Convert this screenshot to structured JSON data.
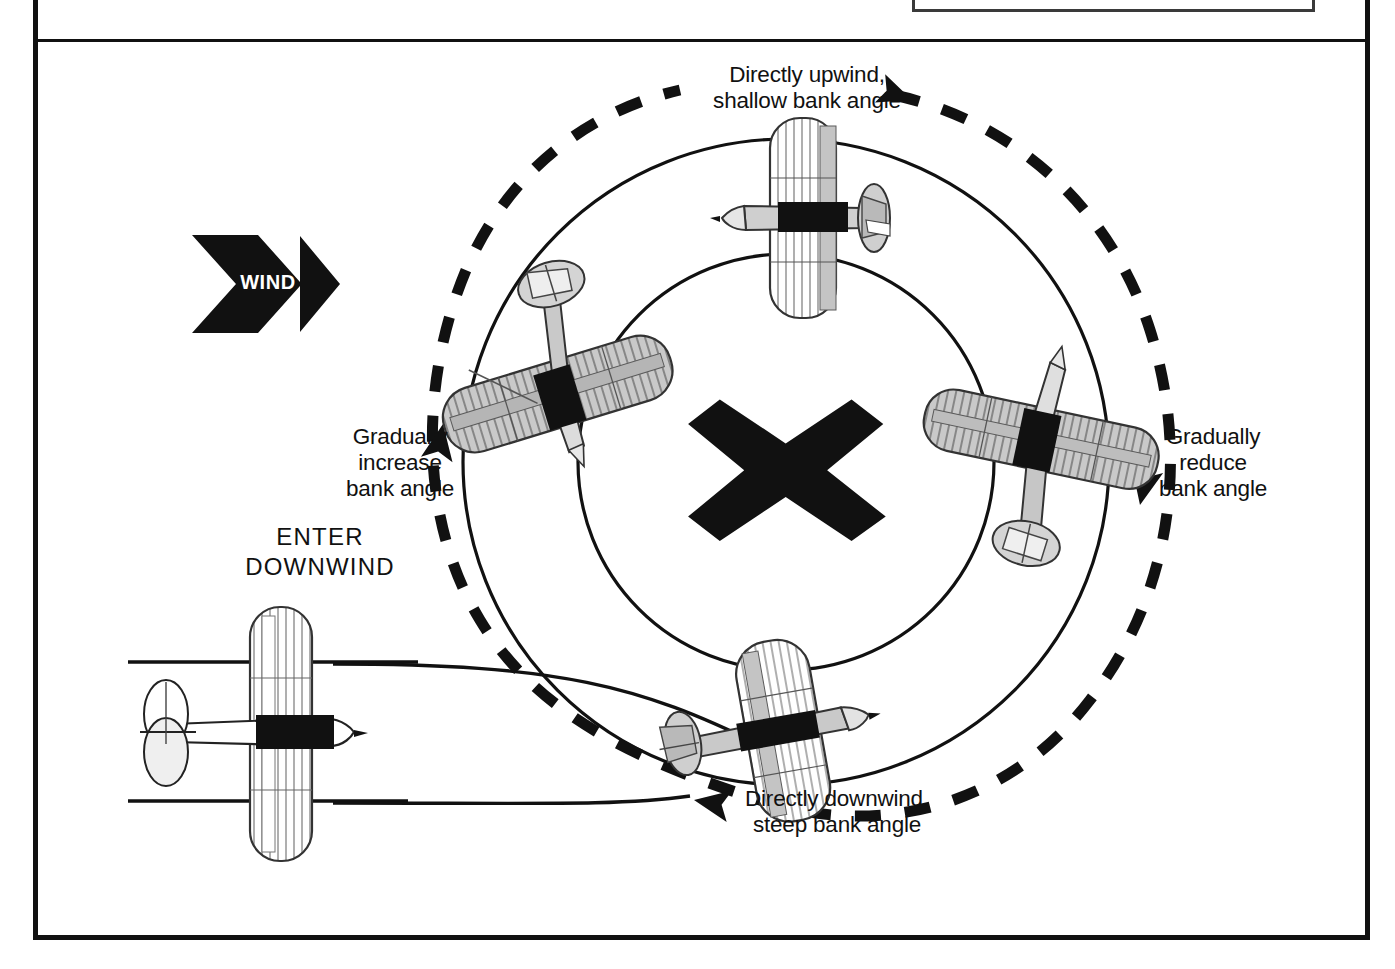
{
  "diagram": {
    "center_marker": "x-ground-reference-point",
    "wind": {
      "label": "WIND",
      "direction": "left-to-right"
    },
    "labels": {
      "upwind": "Directly upwind,\nshallow bank angle",
      "downwind": "Directly downwind,\nsteep bank angle",
      "increase_bank": "Gradually\nincrease\nbank angle",
      "reduce_bank": "Gradually\nreduce\nbank angle",
      "enter": "ENTER\nDOWNWIND"
    },
    "aircraft": [
      {
        "name": "aircraft-upwind",
        "position": "top",
        "bank": "shallow"
      },
      {
        "name": "aircraft-crosswind-left",
        "position": "left",
        "bank": "increasing"
      },
      {
        "name": "aircraft-crosswind-right",
        "position": "right",
        "bank": "decreasing"
      },
      {
        "name": "aircraft-downwind",
        "position": "bottom",
        "bank": "steep"
      },
      {
        "name": "aircraft-entry",
        "position": "left-entry",
        "bank": "level"
      }
    ],
    "colors": {
      "ink": "#111111",
      "frame": "#111111",
      "paper": "#ffffff",
      "aircraft_fill": "#d8d8d8",
      "aircraft_shadow": "#9a9a9a"
    },
    "caption_box": ""
  }
}
